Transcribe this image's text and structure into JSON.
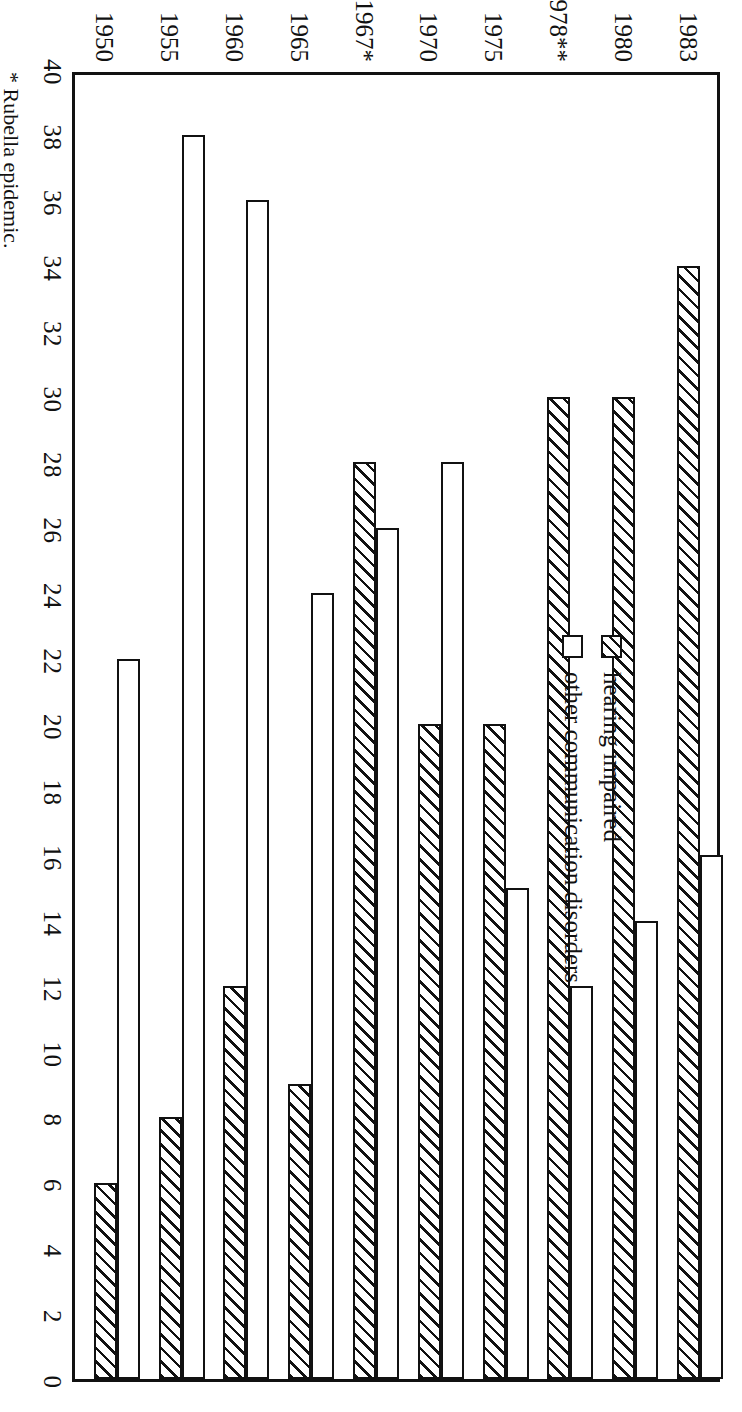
{
  "chart_data": {
    "type": "bar",
    "title": "",
    "subtitle": "",
    "orientation": "horizontal",
    "xlabel": "",
    "ylabel": "",
    "categories": [
      "1950",
      "1955",
      "1960",
      "1965",
      "1967*",
      "1970",
      "1975",
      "1978**",
      "1980",
      "1983"
    ],
    "series": [
      {
        "name": "hearing impaired",
        "pattern": "diagonal-hatch",
        "values": [
          6,
          8,
          12,
          9,
          28,
          20,
          20,
          30,
          30,
          34
        ]
      },
      {
        "name": "other communication disorders",
        "pattern": "white-outline",
        "values": [
          22,
          38,
          36,
          24,
          26,
          28,
          15,
          12,
          14,
          16
        ]
      }
    ],
    "value_axis_ticks": [
      40,
      38,
      36,
      34,
      32,
      30,
      28,
      26,
      24,
      22,
      20,
      18,
      16,
      14,
      12,
      10,
      8,
      6,
      4,
      2,
      0
    ],
    "value_axis_min": 0,
    "value_axis_max": 40,
    "grid": false,
    "legend_position": "inside-upper-left"
  },
  "legend": {
    "items": [
      {
        "label": "hearing impaired",
        "swatch": "hatched-swatch"
      },
      {
        "label": "other communication disorders",
        "swatch": "white-swatch"
      }
    ]
  },
  "footnotes": [
    "* Rubella epidemic."
  ],
  "colors": {
    "ink": "#111111",
    "paper": "#ffffff"
  }
}
